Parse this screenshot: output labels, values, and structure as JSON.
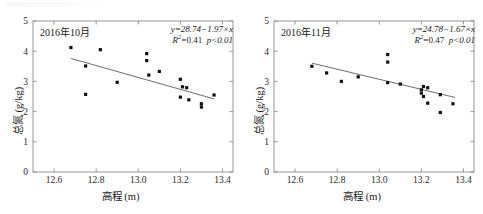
{
  "figure": {
    "panel_count": 2
  },
  "chart_data": [
    {
      "type": "scatter",
      "panel_label": "2016年10月",
      "title": "",
      "xlabel": "高程 (m)",
      "ylabel": "总氮 (g/kg)",
      "xlim": [
        12.5,
        13.45
      ],
      "ylim": [
        0,
        5
      ],
      "xticks": [
        "12.6",
        "12.8",
        "13.0",
        "13.2",
        "13.4"
      ],
      "xtick_values": [
        12.6,
        12.8,
        13.0,
        13.2,
        13.4
      ],
      "yticks": [
        "0",
        "1",
        "2",
        "3",
        "4",
        "5"
      ],
      "ytick_values": [
        0,
        1,
        2,
        3,
        4,
        5
      ],
      "grid": false,
      "legend": "none",
      "marker": "square",
      "marker_color": "#111111",
      "line_color": "#6d6d6d",
      "equation": "y=28.74−1.97×x",
      "slope": -1.97,
      "intercept": 28.74,
      "r_squared_label": "R",
      "r_squared_value": "=0.41",
      "p_value": "p<0.01",
      "fit_x_range": [
        12.68,
        13.36
      ],
      "points": [
        {
          "x": 12.68,
          "y": 4.12
        },
        {
          "x": 12.75,
          "y": 3.51
        },
        {
          "x": 12.75,
          "y": 2.57
        },
        {
          "x": 12.82,
          "y": 4.05
        },
        {
          "x": 12.9,
          "y": 2.97
        },
        {
          "x": 13.04,
          "y": 3.92
        },
        {
          "x": 13.04,
          "y": 3.69
        },
        {
          "x": 13.05,
          "y": 3.21
        },
        {
          "x": 13.1,
          "y": 3.33
        },
        {
          "x": 13.2,
          "y": 3.07
        },
        {
          "x": 13.21,
          "y": 2.82
        },
        {
          "x": 13.23,
          "y": 2.79
        },
        {
          "x": 13.2,
          "y": 2.48
        },
        {
          "x": 13.24,
          "y": 2.39
        },
        {
          "x": 13.3,
          "y": 2.26
        },
        {
          "x": 13.3,
          "y": 2.15
        },
        {
          "x": 13.36,
          "y": 2.55
        }
      ]
    },
    {
      "type": "scatter",
      "panel_label": "2016年11月",
      "title": "",
      "xlabel": "高程 (m)",
      "ylabel": "总氮 (g/kg)",
      "xlim": [
        12.5,
        13.45
      ],
      "ylim": [
        0,
        5
      ],
      "xticks": [
        "12.6",
        "12.8",
        "13.0",
        "13.2",
        "13.4"
      ],
      "xtick_values": [
        12.6,
        12.8,
        13.0,
        13.2,
        13.4
      ],
      "yticks": [
        "0",
        "1",
        "2",
        "3",
        "4",
        "5"
      ],
      "ytick_values": [
        0,
        1,
        2,
        3,
        4,
        5
      ],
      "grid": false,
      "legend": "none",
      "marker": "square",
      "marker_color": "#111111",
      "line_color": "#6d6d6d",
      "equation": "y=24.78−1.67×x",
      "slope": -1.67,
      "intercept": 24.78,
      "r_squared_label": "R",
      "r_squared_value": "=0.47",
      "p_value": "p<0.01",
      "fit_x_range": [
        12.68,
        13.36
      ],
      "points": [
        {
          "x": 12.68,
          "y": 3.5
        },
        {
          "x": 12.75,
          "y": 3.28
        },
        {
          "x": 12.82,
          "y": 3.0
        },
        {
          "x": 12.9,
          "y": 3.15
        },
        {
          "x": 13.04,
          "y": 3.89
        },
        {
          "x": 13.04,
          "y": 3.64
        },
        {
          "x": 13.04,
          "y": 2.96
        },
        {
          "x": 13.1,
          "y": 2.91
        },
        {
          "x": 13.2,
          "y": 2.72
        },
        {
          "x": 13.21,
          "y": 2.83
        },
        {
          "x": 13.23,
          "y": 2.79
        },
        {
          "x": 13.2,
          "y": 2.61
        },
        {
          "x": 13.21,
          "y": 2.5
        },
        {
          "x": 13.23,
          "y": 2.28
        },
        {
          "x": 13.29,
          "y": 2.56
        },
        {
          "x": 13.29,
          "y": 1.97
        },
        {
          "x": 13.35,
          "y": 2.26
        }
      ]
    }
  ]
}
